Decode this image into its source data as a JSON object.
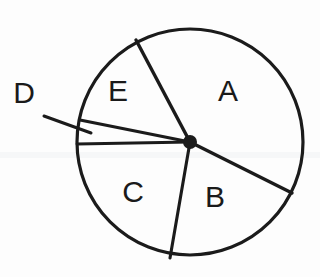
{
  "figure": {
    "background_color": "#fdfdfd",
    "stroke_color": "#1b1b1b",
    "label_color": "#1a1a1a",
    "circle": {
      "cx": 190,
      "cy": 142,
      "r": 113,
      "stroke_width": 3.2
    },
    "center_hub": {
      "cx": 190,
      "cy": 142,
      "r": 7,
      "color": "#1b1b1b"
    }
  },
  "chart_data": {
    "type": "pie",
    "categories": [
      "A",
      "B",
      "C",
      "D",
      "E"
    ],
    "values": [
      96,
      67,
      74,
      12,
      58
    ],
    "unit": "degrees",
    "xlabel": "",
    "ylabel": "",
    "legend": "none",
    "grid": false,
    "sectors": [
      {
        "name": "A",
        "start_angle_deg": 27,
        "end_angle_deg": 123,
        "sweep_deg": 96,
        "label_position": {
          "x": 228,
          "y": 91
        }
      },
      {
        "name": "B",
        "start_angle_deg": -25,
        "end_angle_deg": 27,
        "sweep_deg": 52,
        "label_position": {
          "x": 215,
          "y": 197
        }
      },
      {
        "name": "C",
        "start_angle_deg": -25,
        "end_angle_deg": -90,
        "sweep_deg": 103,
        "label_position": {
          "x": 133,
          "y": 192
        }
      },
      {
        "name": "D",
        "start_angle_deg": 169,
        "end_angle_deg": 180,
        "sweep_deg": 11,
        "label_position": {
          "x": 24,
          "y": 93
        }
      },
      {
        "name": "E",
        "start_angle_deg": 123,
        "end_angle_deg": 169,
        "sweep_deg": 46,
        "label_position": {
          "x": 118,
          "y": 91
        }
      }
    ],
    "radii": [
      {
        "name": "radius-e-a",
        "from": [
          190,
          142
        ],
        "to": [
          136,
          40
        ]
      },
      {
        "name": "radius-a-b",
        "from": [
          190,
          142
        ],
        "to": [
          292,
          193
        ]
      },
      {
        "name": "radius-b-c",
        "from": [
          190,
          142
        ],
        "to": [
          170,
          258
        ]
      },
      {
        "name": "radius-c-d",
        "from": [
          190,
          142
        ],
        "to": [
          77,
          144
        ]
      },
      {
        "name": "radius-d-e",
        "from": [
          190,
          142
        ],
        "to": [
          80,
          120
        ]
      }
    ],
    "leader_line": {
      "name": "leader-line-d",
      "from": [
        44,
        116
      ],
      "to": [
        91,
        133
      ]
    }
  },
  "labels": {
    "a": "A",
    "b": "B",
    "c": "C",
    "d": "D",
    "e": "E"
  }
}
